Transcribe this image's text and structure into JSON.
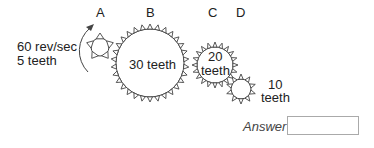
{
  "gears": [
    {
      "id": "A",
      "label": "A",
      "teeth": 5,
      "cx": 100,
      "cy": 47,
      "r": 9,
      "tooth": 5,
      "text": ""
    },
    {
      "id": "B",
      "label": "B",
      "teeth": 30,
      "cx": 150,
      "cy": 63,
      "r": 34,
      "tooth": 5,
      "text": "30 teeth"
    },
    {
      "id": "C",
      "label": "C",
      "teeth": 20,
      "cx": 215,
      "cy": 65,
      "r": 18,
      "tooth": 5,
      "text": "20 teeth"
    },
    {
      "id": "D",
      "label": "D",
      "teeth": 10,
      "cx": 241,
      "cy": 89,
      "r": 10,
      "tooth": 5,
      "text": "10 teeth"
    }
  ],
  "labels": {
    "a": "A",
    "b": "B",
    "c": "C",
    "d": "D",
    "speed_line1": "60 rev/sec",
    "speed_line2": "5 teeth",
    "b_text": "30 teeth",
    "c_text_line1": "20",
    "c_text_line2": "teeth",
    "d_text_line1": "10",
    "d_text_line2": "teeth"
  },
  "answer": {
    "label": "Answer",
    "value": "",
    "placeholder": ""
  },
  "colors": {
    "stroke": "#444444",
    "text": "#222222"
  }
}
